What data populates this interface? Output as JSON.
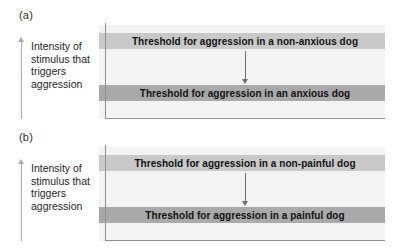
{
  "figure": {
    "axis_caption": "Intensity of\nstimulus that\ntriggers\naggression",
    "colors": {
      "band_upper": "#c9c9c9",
      "band_lower": "#a9a9a9",
      "plot_background": "#f3f3f3",
      "axis_line": "#8f8f8f",
      "arrow": "#6e6e6e"
    }
  },
  "panels": [
    {
      "label": "(a)",
      "upper_band_text": "Threshold for aggression in a non-anxious dog",
      "lower_band_text": "Threshold for aggression in an anxious dog",
      "axis_caption": "Intensity of\nstimulus that\ntriggers\naggression"
    },
    {
      "label": "(b)",
      "upper_band_text": "Threshold for aggression in a non-painful dog",
      "lower_band_text": "Threshold for aggression in a painful dog",
      "axis_caption": "Intensity of\nstimulus that\ntriggers\naggression"
    }
  ]
}
